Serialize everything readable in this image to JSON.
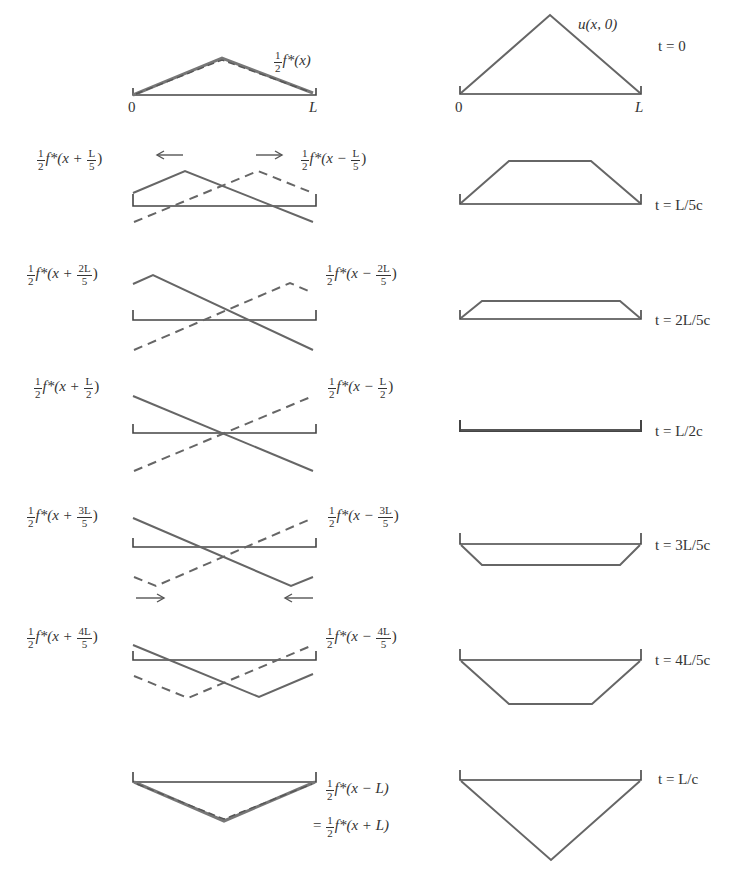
{
  "figure": {
    "line_color": "#666666",
    "axis_color": "#444444",
    "left_column": {
      "initial": {
        "label_prefix": "f*(x)",
        "axis_start": "0",
        "axis_end": "L"
      },
      "rows": [
        {
          "left_num": "L",
          "left_den": "5",
          "left_prefix": "f*(x + ",
          "right_num": "L",
          "right_den": "5",
          "right_prefix": "f*(x − ",
          "arrows": "outward"
        },
        {
          "left_num": "2L",
          "left_den": "5",
          "left_prefix": "f*(x + ",
          "right_num": "2L",
          "right_den": "5",
          "right_prefix": "f*(x − "
        },
        {
          "left_num": "L",
          "left_den": "2",
          "left_prefix": "f*(x + ",
          "right_num": "L",
          "right_den": "2",
          "right_prefix": "f*(x − "
        },
        {
          "left_num": "3L",
          "left_den": "5",
          "left_prefix": "f*(x + ",
          "right_num": "3L",
          "right_den": "5",
          "right_prefix": "f*(x − ",
          "arrows": "inward"
        },
        {
          "left_num": "4L",
          "left_den": "5",
          "left_prefix": "f*(x + ",
          "right_num": "4L",
          "right_den": "5",
          "right_prefix": "f*(x − "
        }
      ],
      "final": {
        "line1": "f*(x − L)",
        "line2_prefix": "= ",
        "line2": "f*(x + L)"
      },
      "half_num": "1",
      "half_den": "2",
      "close_paren": ")"
    },
    "right_column": {
      "initial_label": "u(x, 0)",
      "axis_start": "0",
      "axis_end": "L",
      "times": [
        "t = 0",
        "t = L/5c",
        "t = 2L/5c",
        "t = L/2c",
        "t = 3L/5c",
        "t = 4L/5c",
        "t = L/c"
      ]
    }
  }
}
